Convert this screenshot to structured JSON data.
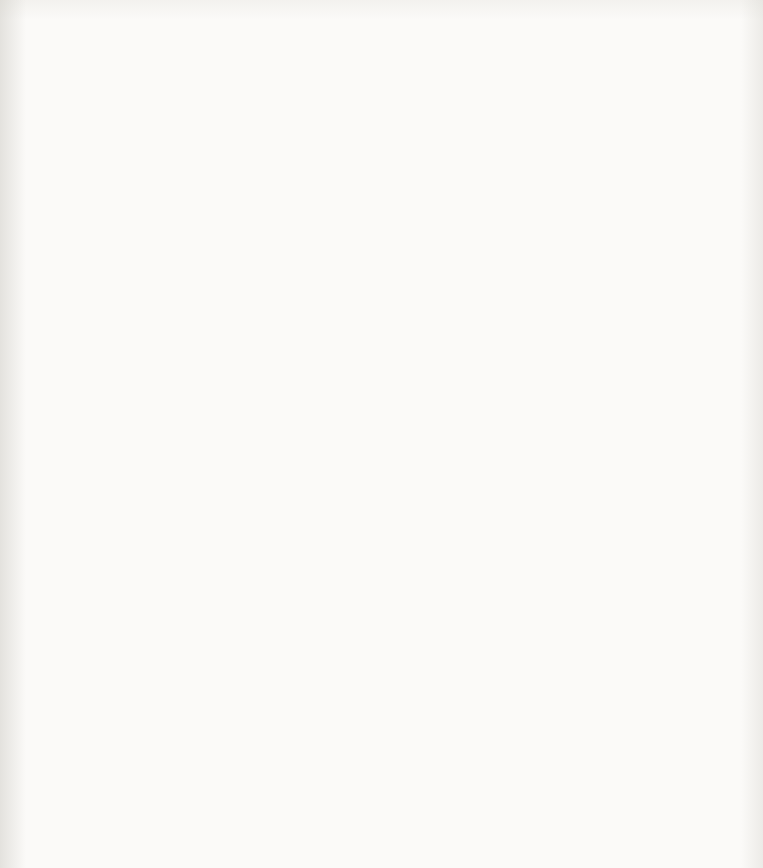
{
  "page": {
    "page_number": "22",
    "instructions_note": "Instructions on page 21"
  },
  "axes": {
    "x_ticks": [
      "0",
      "1",
      "2",
      "3",
      "4",
      "5",
      "6",
      "7",
      "8",
      "9",
      "10",
      "11",
      "12"
    ],
    "y_ticks": [
      "0",
      "1",
      "2",
      "3",
      "4",
      "5",
      "6",
      "7",
      "8",
      "9",
      "10",
      "11",
      "12",
      "13"
    ],
    "xlim": [
      0,
      12
    ],
    "ylim": [
      0,
      13
    ],
    "grid": "on",
    "grid_color": "#b9bcc0",
    "ink_color": "#111111"
  },
  "chart_data": {
    "type": "line",
    "xlabel": "",
    "ylabel": "",
    "xlim": [
      0,
      12
    ],
    "ylim": [
      0,
      13
    ],
    "grid": true,
    "legend": "none",
    "segments": [
      {
        "id": "A",
        "shape": "line",
        "start": {
          "x": 1.7,
          "y": 10.4,
          "label": "1"
        },
        "end": {
          "x": 5.1,
          "y": 12.4,
          "label": "9"
        },
        "label_at": {
          "x": 3.55,
          "y": 11.62
        },
        "start_label_pos": "below-left",
        "end_label_pos": "below-right"
      },
      {
        "id": "B",
        "shape": "line",
        "start": {
          "x": 6.9,
          "y": 12.4,
          "label": "1"
        },
        "end": {
          "x": 10.4,
          "y": 10.38,
          "label": "9"
        },
        "label_at": {
          "x": 8.62,
          "y": 11.62
        },
        "start_label_pos": "below-left",
        "end_label_pos": "below-right"
      },
      {
        "id": "C",
        "shape": "line",
        "start": {
          "x": 11.22,
          "y": 9.0,
          "label": "1"
        },
        "end": {
          "x": 11.22,
          "y": 4.85,
          "label": "9"
        },
        "label_at": {
          "x": 11.1,
          "y": 7.02
        },
        "start_label_pos": "above",
        "end_label_pos": "below"
      },
      {
        "id": "D",
        "shape": "line",
        "start": {
          "x": 6.9,
          "y": 1.45,
          "label": "9"
        },
        "end": {
          "x": 10.35,
          "y": 3.4,
          "label": "1"
        },
        "label_at": {
          "x": 8.62,
          "y": 2.12
        },
        "start_label_pos": "below-left",
        "end_label_pos": "above-right"
      },
      {
        "id": "E",
        "shape": "line",
        "start": {
          "x": 1.7,
          "y": 3.4,
          "label": "9"
        },
        "end": {
          "x": 5.1,
          "y": 1.4,
          "label": "1"
        },
        "label_at": {
          "x": 3.42,
          "y": 2.15
        },
        "start_label_pos": "above-left",
        "end_label_pos": "below-right"
      },
      {
        "id": "F",
        "shape": "line",
        "start": {
          "x": 0.86,
          "y": 8.95,
          "label": "9"
        },
        "end": {
          "x": 0.86,
          "y": 4.95,
          "label": "1"
        },
        "label_at": {
          "x": 0.73,
          "y": 7.02
        },
        "start_label_pos": "above",
        "end_label_pos": "below"
      },
      {
        "id": "G",
        "shape": "arc",
        "start": {
          "x": 4.38,
          "y": 8.45,
          "label": "1"
        },
        "end": {
          "x": 5.72,
          "y": 8.88,
          "label": "9"
        },
        "bulge": "up",
        "label_at": {
          "x": 4.82,
          "y": 8.9
        },
        "start_label_pos": "below-left",
        "end_label_pos": "right"
      },
      {
        "id": "H",
        "shape": "arc",
        "start": {
          "x": 6.4,
          "y": 8.88,
          "label": "1"
        },
        "end": {
          "x": 7.62,
          "y": 8.42,
          "label": "9"
        },
        "bulge": "up",
        "label_at": {
          "x": 7.18,
          "y": 8.9
        },
        "start_label_pos": "left",
        "end_label_pos": "below-right"
      },
      {
        "id": "J",
        "shape": "arc",
        "start": {
          "x": 8.4,
          "y": 7.62,
          "label": "1"
        },
        "end": {
          "x": 8.4,
          "y": 6.28,
          "label": "9"
        },
        "bulge": "right",
        "label_at": {
          "x": 8.62,
          "y": 7.0
        },
        "start_label_pos": "above",
        "end_label_pos": "below"
      },
      {
        "id": "K",
        "shape": "arc",
        "start": {
          "x": 6.45,
          "y": 5.0,
          "label": "9"
        },
        "end": {
          "x": 7.62,
          "y": 5.38,
          "label": "1"
        },
        "bulge": "down",
        "label_at": {
          "x": 7.16,
          "y": 4.96
        },
        "start_label_pos": "left",
        "end_label_pos": "above-right"
      },
      {
        "id": "L",
        "shape": "arc",
        "start": {
          "x": 4.4,
          "y": 5.42,
          "label": "9"
        },
        "end": {
          "x": 5.62,
          "y": 5.0,
          "label": "1"
        },
        "bulge": "down",
        "label_at": {
          "x": 4.82,
          "y": 4.96
        },
        "start_label_pos": "above-left",
        "end_label_pos": "right"
      },
      {
        "id": "M",
        "shape": "arc",
        "start": {
          "x": 3.62,
          "y": 7.62,
          "label": "9"
        },
        "end": {
          "x": 3.62,
          "y": 6.3,
          "label": "1"
        },
        "bulge": "left",
        "label_at": {
          "x": 3.38,
          "y": 7.0
        },
        "start_label_pos": "above",
        "end_label_pos": "below"
      }
    ]
  }
}
